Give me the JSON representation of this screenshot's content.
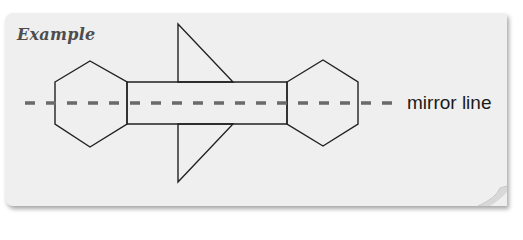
{
  "card": {
    "title": "Example",
    "background": "#efefef"
  },
  "diagram": {
    "shapes": {
      "left_hexagon": [
        [
          55,
          82
        ],
        [
          90,
          61
        ],
        [
          127,
          82
        ],
        [
          127,
          124
        ],
        [
          90,
          147
        ],
        [
          55,
          124
        ]
      ],
      "rectangle": [
        [
          127,
          82
        ],
        [
          287,
          82
        ],
        [
          287,
          124
        ],
        [
          127,
          124
        ]
      ],
      "right_hexagon": [
        [
          287,
          82
        ],
        [
          323,
          60
        ],
        [
          358,
          82
        ],
        [
          358,
          124
        ],
        [
          323,
          146
        ],
        [
          287,
          124
        ]
      ],
      "top_triangle": [
        [
          178,
          24
        ],
        [
          178,
          82
        ],
        [
          233,
          82
        ]
      ],
      "bottom_triangle": [
        [
          178,
          182
        ],
        [
          178,
          124
        ],
        [
          233,
          124
        ]
      ]
    },
    "mirror_line": {
      "y": 103,
      "x_start": 25,
      "x_end": 400,
      "style": "dashed",
      "color": "#6a6a6a"
    },
    "stroke_color": "#222222",
    "mirror_label": "mirror line"
  }
}
